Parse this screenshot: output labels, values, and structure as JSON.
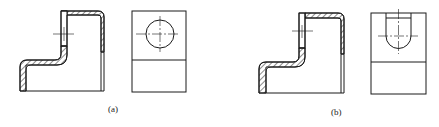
{
  "figure": {
    "panels": [
      {
        "id": "a",
        "label": "(a)",
        "description": "Sectional front view with hatched wall and side view with circular hole"
      },
      {
        "id": "b",
        "label": "(b)",
        "description": "Sectional front view with hatched wall and side view with U-shaped slot"
      }
    ],
    "colors": {
      "line": "#1a1a1a",
      "background": "#ffffff"
    }
  }
}
